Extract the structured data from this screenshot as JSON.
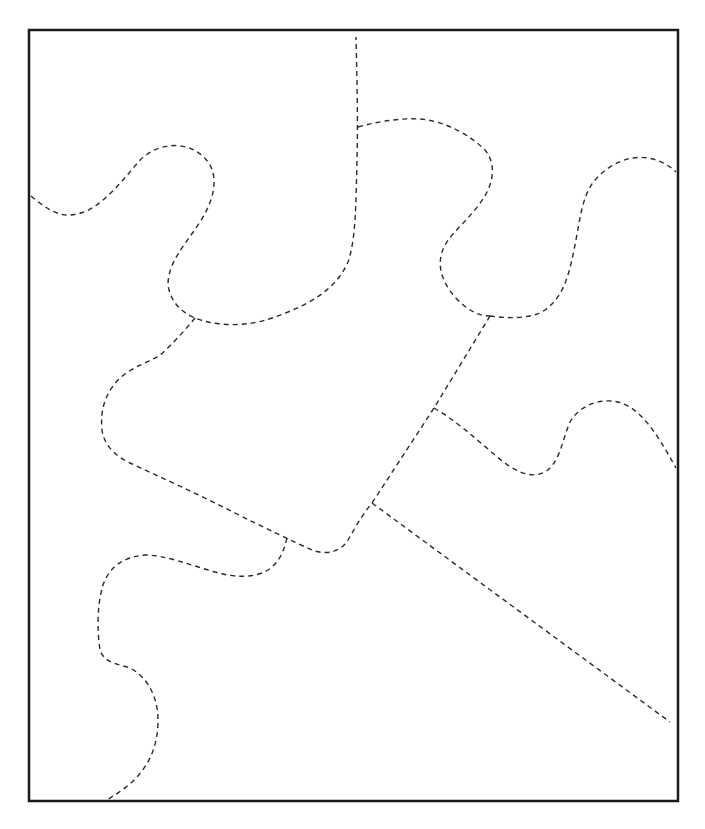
{
  "diagram": {
    "type": "puzzle-template",
    "colors": {
      "background": "#ffffff",
      "frame_stroke": "#1a1a1a",
      "cut_line_stroke": "#2a2a2a"
    },
    "frame": {
      "x": 29,
      "y": 30,
      "width": 649,
      "height": 771
    },
    "cut_lines": [
      {
        "id": "top-left-curve",
        "d": "M31,196 C45,208 58,216 70,215 C95,214 115,190 140,160 C160,140 195,140 210,165 C218,180 214,200 200,222 C185,245 168,262 168,285 C170,300 180,312 195,318 C215,326 245,328 275,317 C305,306 335,292 348,262 C356,240 356,200 357,160 C358,120 357,80 356,37"
      },
      {
        "id": "top-center-tab",
        "d": "M358,127 C380,121 400,118 420,119 C445,121 470,135 485,150 C495,162 494,178 487,192 C475,215 455,228 445,245 C436,262 440,280 455,297 C467,310 478,316 490,316"
      },
      {
        "id": "top-right-tab",
        "d": "M490,316 C505,318 530,320 545,310 C565,296 570,270 575,245 C580,220 582,195 595,180 C610,163 630,155 648,158 C660,160 670,166 676,172"
      },
      {
        "id": "center-left-outline",
        "d": "M195,318 C185,330 172,345 160,355 C150,362 135,365 120,378 C105,393 100,410 102,430 C104,445 115,456 130,463 C160,477 200,495 235,513 C265,528 290,540 312,550 C325,555 340,553 348,540 C355,528 362,515 372,503"
      },
      {
        "id": "center-diagonal",
        "d": "M490,316 L434,408 L372,503"
      },
      {
        "id": "right-middle-tab",
        "d": "M434,408 C455,420 475,438 495,455 C512,470 530,480 545,472 C560,463 562,440 570,422 C580,405 600,398 618,402 C640,408 655,430 676,468"
      },
      {
        "id": "lower-diagonal",
        "d": "M372,503 L670,722"
      },
      {
        "id": "bottom-left-tab",
        "d": "M287,538 C284,550 280,562 268,570 C255,578 235,578 215,572 C190,565 165,555 145,555 C125,557 110,565 103,585 C97,605 97,630 100,650 C104,663 118,664 130,668 C148,677 158,698 158,720 C158,745 150,765 132,782 C122,791 113,796 107,800"
      }
    ],
    "pieces": [
      {
        "id": "piece-top-left",
        "label": "Piece 1"
      },
      {
        "id": "piece-top-middle",
        "label": "Piece 2"
      },
      {
        "id": "piece-top-right",
        "label": "Piece 3"
      },
      {
        "id": "piece-center",
        "label": "Piece 4"
      },
      {
        "id": "piece-right-middle",
        "label": "Piece 5"
      },
      {
        "id": "piece-bottom-right",
        "label": "Piece 6"
      },
      {
        "id": "piece-bottom-left",
        "label": "Piece 7"
      }
    ]
  }
}
